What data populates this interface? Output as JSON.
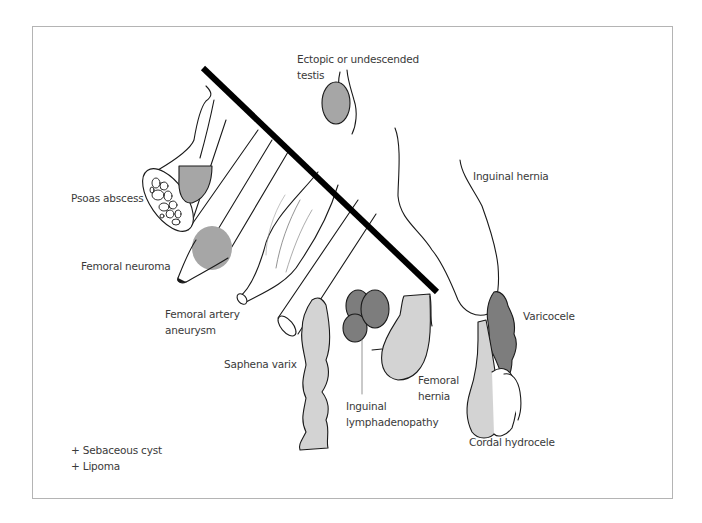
{
  "diagram": {
    "labels": {
      "ectopic_testis": [
        "Ectopic or undescended",
        "testis"
      ],
      "inguinal_hernia": "Inguinal hernia",
      "psoas_abscess": "Psoas abscess",
      "femoral_neuroma": "Femoral neuroma",
      "femoral_artery_aneurysm": [
        "Femoral artery",
        "aneurysm"
      ],
      "saphena_varix": "Saphena varix",
      "inguinal_lymphadenopathy": [
        "Inguinal",
        "lymphadenopathy"
      ],
      "femoral_hernia": [
        "Femoral",
        "hernia"
      ],
      "varicocele": "Varicocele",
      "cordal_hydrocele": "Cordal hydrocele"
    },
    "footnotes": [
      "+ Sebaceous cyst",
      "+ Lipoma"
    ],
    "colors": {
      "outline": "#1a1a1a",
      "mid_grey": "#a6a6a6",
      "light_grey": "#d3d3d3",
      "dark_grey": "#7d7d7d",
      "border": "#b4b4b4",
      "text": "#3a3a3a"
    }
  }
}
